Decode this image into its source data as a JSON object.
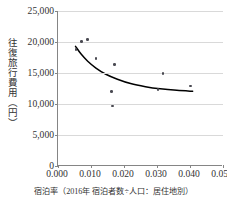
{
  "chart_data": {
    "type": "scatter",
    "title": "",
    "xlabel": "宿泊率（2016年 宿泊者数÷人口：居住地別）",
    "ylabel": "往復旅行費用（円）",
    "xlim": [
      0.0,
      0.05
    ],
    "ylim": [
      0,
      25000
    ],
    "xticks": [
      "0.000",
      "0.010",
      "0.020",
      "0.030",
      "0.040",
      "0.050"
    ],
    "xtick_values": [
      0.0,
      0.01,
      0.02,
      0.03,
      0.04,
      0.05
    ],
    "yticks": [
      "0",
      "5,000",
      "10,000",
      "15,000",
      "20,000",
      "25,000"
    ],
    "ytick_values": [
      0,
      5000,
      10000,
      15000,
      20000,
      25000
    ],
    "grid": "horizontal",
    "legend": "none",
    "points": [
      {
        "x": 0.0055,
        "y": 18800
      },
      {
        "x": 0.0072,
        "y": 20100
      },
      {
        "x": 0.0089,
        "y": 20400
      },
      {
        "x": 0.0115,
        "y": 17300
      },
      {
        "x": 0.0163,
        "y": 12000
      },
      {
        "x": 0.0165,
        "y": 9700
      },
      {
        "x": 0.0172,
        "y": 16400
      },
      {
        "x": 0.0303,
        "y": 12300
      },
      {
        "x": 0.0318,
        "y": 14950
      },
      {
        "x": 0.0401,
        "y": 12900
      }
    ],
    "trendline": {
      "style": "power-curve",
      "color": "#000000",
      "points": [
        {
          "x": 0.0053,
          "y": 19300
        },
        {
          "x": 0.007,
          "y": 18050
        },
        {
          "x": 0.009,
          "y": 16900
        },
        {
          "x": 0.0115,
          "y": 15800
        },
        {
          "x": 0.0145,
          "y": 14800
        },
        {
          "x": 0.018,
          "y": 14000
        },
        {
          "x": 0.022,
          "y": 13300
        },
        {
          "x": 0.0265,
          "y": 12800
        },
        {
          "x": 0.031,
          "y": 12450
        },
        {
          "x": 0.036,
          "y": 12200
        },
        {
          "x": 0.0408,
          "y": 12050
        }
      ]
    },
    "colors": {
      "point": "#4a4a52",
      "trend": "#000000",
      "grid": "#d9d9d9",
      "axis": "#858585",
      "text": "#333333",
      "background": "#ffffff"
    }
  }
}
